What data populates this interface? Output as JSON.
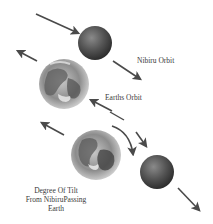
{
  "labels": {
    "nibiru_orbit": "Nibiru Orbit",
    "earths_orbit": "Earths Orbit",
    "tilt_line1": "Degree Of Tilt",
    "tilt_line2": "From NibiruPassing",
    "tilt_line3": "Earth"
  },
  "bodies": [
    {
      "name": "nibiru",
      "position": "top",
      "color": "#5a5a5a"
    },
    {
      "name": "earth",
      "position": "top",
      "color": "#8a8a8a"
    },
    {
      "name": "earth",
      "position": "bottom",
      "color": "#8a8a8a"
    },
    {
      "name": "nibiru",
      "position": "bottom",
      "color": "#5a5a5a"
    }
  ],
  "colors": {
    "arrow": "#4a4a4a",
    "background": "#ffffff",
    "text": "#3a3a3a"
  }
}
